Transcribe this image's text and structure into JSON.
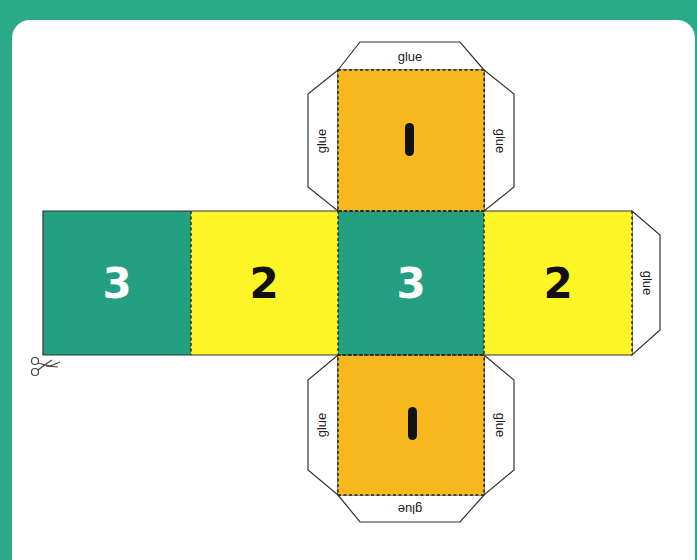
{
  "worksheet": {
    "title": "Dice net template",
    "colors": {
      "frame": "#2aaa87",
      "green_face": "#239f81",
      "yellow_face": "#fdf528",
      "orange_face": "#f7b81e",
      "flap": "#ffffff",
      "outline": "#333333"
    },
    "faces": [
      {
        "id": "top",
        "label": "1",
        "color": "orange"
      },
      {
        "id": "left-far",
        "label": "3",
        "color": "green"
      },
      {
        "id": "left",
        "label": "2",
        "color": "yellow"
      },
      {
        "id": "center",
        "label": "3",
        "color": "green"
      },
      {
        "id": "right",
        "label": "2",
        "color": "yellow"
      },
      {
        "id": "bottom",
        "label": "1",
        "color": "orange"
      }
    ],
    "flaps": {
      "top_top": "glue",
      "top_left": "glue",
      "top_right": "glue",
      "right_end": "glue",
      "bottom_left": "glue",
      "bottom_right": "glue",
      "bottom_bottom": "glue"
    },
    "cut_marker": "scissors-icon"
  }
}
